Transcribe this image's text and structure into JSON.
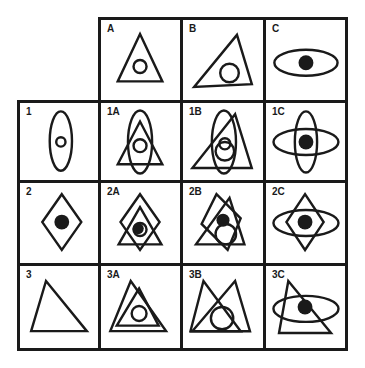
{
  "puzzle": {
    "column_headers": [
      {
        "label": "A",
        "figure": "upright triangle with small circle inside"
      },
      {
        "label": "B",
        "figure": "tilted triangle with circle inside"
      },
      {
        "label": "C",
        "figure": "horizontal ellipse with black dot"
      }
    ],
    "row_headers": [
      {
        "label": "1",
        "figure": "vertical ellipse with small circle"
      },
      {
        "label": "2",
        "figure": "diamond with black dot"
      },
      {
        "label": "3",
        "figure": "triangle"
      }
    ],
    "cells": [
      {
        "label": "1A",
        "figure": "vertical ellipse overlapping upright triangle with circle"
      },
      {
        "label": "1B",
        "figure": "vertical ellipse overlapping tilted triangle with circles"
      },
      {
        "label": "1C",
        "figure": "vertical and horizontal ellipses crossed with black dot"
      },
      {
        "label": "2A",
        "figure": "diamond overlapping triangle with dot in circle"
      },
      {
        "label": "2B",
        "figure": "tilted diamond overlapping triangle with dot and circle"
      },
      {
        "label": "2C",
        "figure": "diamond with horizontal ellipse and black dot"
      },
      {
        "label": "3A",
        "figure": "two nested triangles with circle"
      },
      {
        "label": "3B",
        "figure": "two overlapping triangles with circle"
      },
      {
        "label": "3C",
        "figure": "triangle with horizontal ellipse and black dot"
      }
    ]
  }
}
